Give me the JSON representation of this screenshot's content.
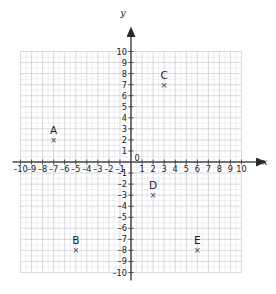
{
  "chart_data": {
    "type": "scatter",
    "title": "",
    "xlabel": "x",
    "ylabel": "y",
    "xlim": [
      -10,
      10
    ],
    "ylim": [
      -10,
      10
    ],
    "grid": true,
    "minor_grid_step": 0.5,
    "major_grid_step": 1,
    "legend": "none",
    "xticks": [
      -10,
      -9,
      -8,
      -7,
      -6,
      -5,
      -4,
      -3,
      -2,
      -1,
      0,
      1,
      2,
      3,
      4,
      5,
      6,
      7,
      8,
      9,
      10
    ],
    "yticks": [
      -10,
      -9,
      -8,
      -7,
      -6,
      -5,
      -4,
      -3,
      -2,
      -1,
      0,
      1,
      2,
      3,
      4,
      5,
      6,
      7,
      8,
      9,
      10
    ],
    "xtick_labels": [
      "–10",
      "–9",
      "–8",
      "–7",
      "–6",
      "–5",
      "–4",
      "–3",
      "–2",
      "–1",
      "0",
      "1",
      "2",
      "3",
      "4",
      "5",
      "6",
      "7",
      "8",
      "9",
      "10"
    ],
    "ytick_labels": [
      "–10",
      "–9",
      "–8",
      "–7",
      "–6",
      "–5",
      "–4",
      "–3",
      "–2",
      "–1",
      "0",
      "1",
      "2",
      "3",
      "4",
      "5",
      "6",
      "7",
      "8",
      "9",
      "10"
    ],
    "marker": "×",
    "points": [
      {
        "label": "A",
        "x": -7,
        "y": 2
      },
      {
        "label": "B",
        "x": -5,
        "y": -8
      },
      {
        "label": "C",
        "x": 3,
        "y": 7
      },
      {
        "label": "D",
        "x": 2,
        "y": -3
      },
      {
        "label": "E",
        "x": 6,
        "y": -8
      }
    ]
  },
  "axes": {
    "x_axis_name": "x",
    "y_axis_name": "y",
    "origin_label": "0"
  },
  "colors": {
    "background": "#ffffff",
    "minor_grid": "#e9e9ef",
    "major_grid": "#cfcfd8",
    "axis": "#4a4a4a",
    "text": "#1a1a1a",
    "marker": "#3a3a3a"
  }
}
